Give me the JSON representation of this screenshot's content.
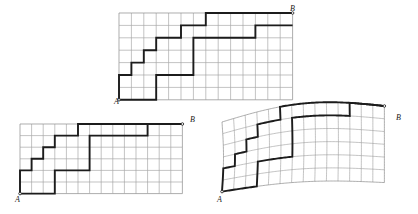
{
  "figure": {
    "background_color": "#ffffff",
    "gridline_color": "#9a9a9a",
    "path_color": "#1c1c1c",
    "label_start": "A",
    "label_end": "B"
  },
  "panels": [
    {
      "id": "top",
      "name": "top-rectangular-grid",
      "x": 119,
      "y": 13,
      "cell": 12.4,
      "cols": 14,
      "rows": 7,
      "deformed": false,
      "start_label": "A",
      "end_label": "B",
      "start_cell": [
        0,
        7
      ],
      "end_cell": [
        14,
        0
      ],
      "path_points": [
        [
          0,
          7
        ],
        [
          0,
          5
        ],
        [
          1,
          5
        ],
        [
          1,
          4
        ],
        [
          2,
          4
        ],
        [
          2,
          3
        ],
        [
          3,
          3
        ],
        [
          3,
          2
        ],
        [
          5,
          2
        ],
        [
          5,
          1
        ],
        [
          7,
          1
        ],
        [
          7,
          0
        ],
        [
          14,
          0
        ]
      ],
      "path2_points": [
        [
          0,
          7
        ],
        [
          3,
          7
        ],
        [
          3,
          5
        ],
        [
          6,
          5
        ],
        [
          6,
          2
        ],
        [
          11,
          2
        ],
        [
          11,
          1
        ],
        [
          14,
          1
        ]
      ],
      "label_a": {
        "x": 114,
        "y": 98
      },
      "label_b": {
        "x": 290,
        "y": 5
      }
    },
    {
      "id": "bottom-left",
      "name": "bottom-left-rectangular-grid",
      "x": 20,
      "y": 124,
      "cell": 11.6,
      "cols": 14,
      "rows": 6,
      "deformed": false,
      "start_label": "A",
      "end_label": "B",
      "start_cell": [
        0,
        6
      ],
      "end_cell": [
        14,
        0
      ],
      "path_points": [
        [
          0,
          6
        ],
        [
          0,
          4
        ],
        [
          1,
          4
        ],
        [
          1,
          3
        ],
        [
          2,
          3
        ],
        [
          2,
          2
        ],
        [
          3,
          2
        ],
        [
          3,
          1
        ],
        [
          5,
          1
        ],
        [
          5,
          0
        ],
        [
          7,
          0
        ],
        [
          7,
          0
        ],
        [
          14,
          0
        ]
      ],
      "path2_points": [
        [
          0,
          6
        ],
        [
          3,
          6
        ],
        [
          3,
          4
        ],
        [
          6,
          4
        ],
        [
          6,
          1
        ],
        [
          11,
          1
        ],
        [
          11,
          0
        ],
        [
          14,
          0
        ]
      ],
      "label_a": {
        "x": 15,
        "y": 196
      },
      "label_b": {
        "x": 190,
        "y": 116
      }
    },
    {
      "id": "bottom-right",
      "name": "bottom-right-deformed-grid",
      "x": 222,
      "y": 122,
      "cell": 11.6,
      "cols": 14,
      "rows": 6,
      "deformed": true,
      "start_label": "A",
      "end_label": "B",
      "start_cell": [
        0,
        6
      ],
      "end_cell": [
        14,
        0
      ],
      "path_points": [
        [
          0,
          6
        ],
        [
          0,
          4
        ],
        [
          1,
          4
        ],
        [
          1,
          3
        ],
        [
          2,
          3
        ],
        [
          2,
          2
        ],
        [
          3,
          2
        ],
        [
          3,
          1
        ],
        [
          5,
          1
        ],
        [
          5,
          0
        ],
        [
          7,
          0
        ],
        [
          14,
          0
        ]
      ],
      "path2_points": [
        [
          0,
          6
        ],
        [
          3,
          6
        ],
        [
          3,
          4
        ],
        [
          6,
          4
        ],
        [
          6,
          1
        ],
        [
          11,
          1
        ],
        [
          11,
          0
        ],
        [
          14,
          0
        ]
      ],
      "label_a": {
        "x": 217,
        "y": 196
      },
      "label_b": {
        "x": 396,
        "y": 114
      }
    }
  ]
}
